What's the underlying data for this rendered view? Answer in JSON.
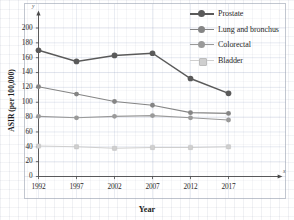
{
  "chart_data": {
    "type": "line",
    "title": "",
    "xlabel": "Year",
    "ylabel": "ASIR (per 100,000)",
    "categories": [
      "1992",
      "1997",
      "2002",
      "2007",
      "2012",
      "2017"
    ],
    "x": [
      1992,
      1997,
      2002,
      2007,
      2012,
      2017
    ],
    "xlim": [
      1990.2,
      2022.0
    ],
    "ylim": [
      0,
      212
    ],
    "y_ticks": [
      0,
      20,
      40,
      60,
      80,
      100,
      120,
      140,
      160,
      180,
      200
    ],
    "x_ticks": [
      "1992",
      "1997",
      "2002",
      "2007",
      "2012",
      "2017"
    ],
    "grid": true,
    "legend_position": "top-right",
    "axis_arrow_labels": {
      "y": "y",
      "x": "x"
    },
    "series": [
      {
        "name": "Prostate",
        "color": "#5a5a5a",
        "marker": "circle",
        "marker_size": "large",
        "values": [
          170,
          155,
          163,
          166,
          132,
          112
        ]
      },
      {
        "name": "Lung and bronchus",
        "color": "#858585",
        "marker": "circle",
        "marker_size": "medium",
        "values": [
          121,
          111,
          101,
          96,
          86,
          85
        ]
      },
      {
        "name": "Colorectal",
        "color": "#9a9a9a",
        "marker": "circle",
        "marker_size": "medium",
        "values": [
          81,
          79,
          81,
          82,
          79,
          76
        ]
      },
      {
        "name": "Bladder",
        "color": "#cfcfcf",
        "marker": "square",
        "marker_size": "small",
        "values": [
          41,
          40,
          38,
          39,
          39,
          40
        ]
      }
    ]
  },
  "legend": {
    "items": [
      {
        "label": "Prostate"
      },
      {
        "label": "Lung and bronchus"
      },
      {
        "label": "Colorectal"
      },
      {
        "label": "Bladder"
      }
    ]
  },
  "axes": {
    "y_label": "ASIR (per 100,000)",
    "x_label": "Year",
    "y_axis_letter": "y",
    "x_axis_letter": "x"
  }
}
